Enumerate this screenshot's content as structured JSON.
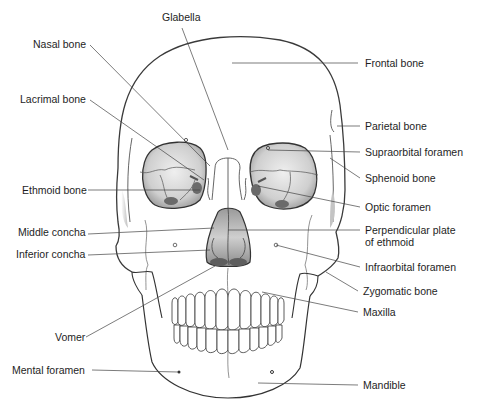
{
  "figure": {
    "colors": {
      "outline": "#3a3a3a",
      "leader": "#444444",
      "fill_orbit": "#c8c8c8",
      "fill_orbit_light": "#ececec",
      "text": "#1e1e1e",
      "background": "#ffffff"
    }
  },
  "labels": {
    "glabella": "Glabella",
    "nasal_bone": "Nasal bone",
    "lacrimal_bone": "Lacrimal bone",
    "ethmoid_bone": "Ethmoid bone",
    "middle_concha": "Middle concha",
    "inferior_concha": "Inferior concha",
    "vomer": "Vomer",
    "mental_foramen": "Mental foramen",
    "frontal_bone": "Frontal bone",
    "parietal_bone": "Parietal bone",
    "supraorbital_foramen": "Supraorbital foramen",
    "sphenoid_bone": "Sphenoid bone",
    "optic_foramen": "Optic foramen",
    "perpendicular_plate_line1": "Perpendicular plate",
    "perpendicular_plate_line2": "of ethmoid",
    "infraorbital_foramen": "Infraorbital foramen",
    "zygomatic_bone": "Zygomatic bone",
    "maxilla": "Maxilla",
    "mandible": "Mandible"
  }
}
